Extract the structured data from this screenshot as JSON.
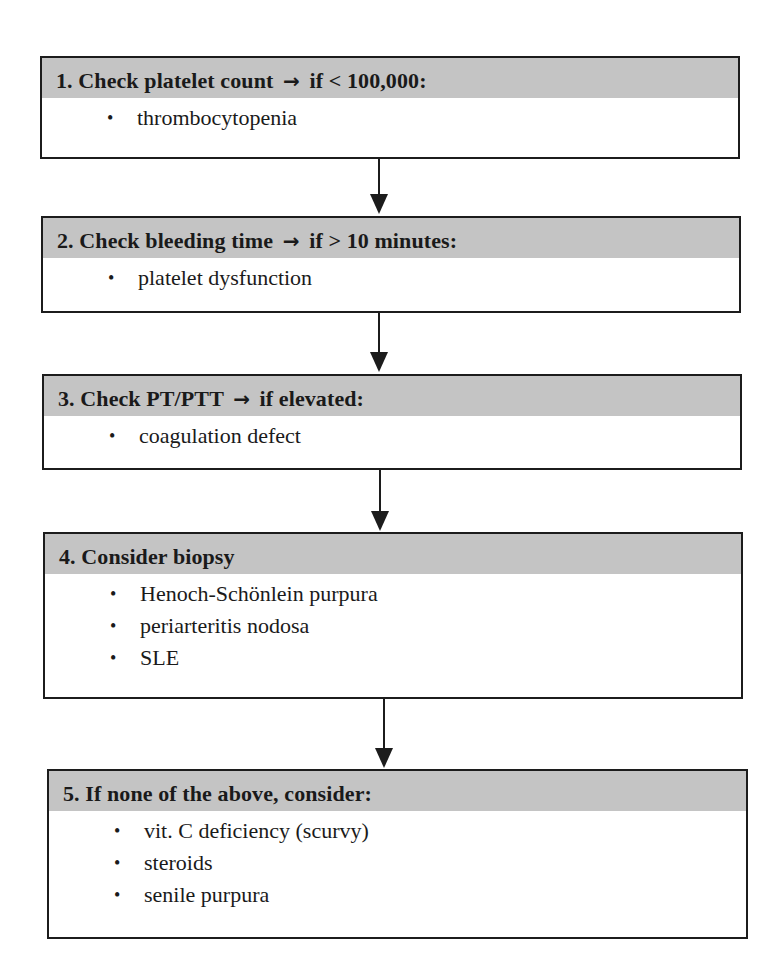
{
  "flowchart": {
    "steps": [
      {
        "number": "1.",
        "title": "Check platelet count",
        "arrow": "→",
        "condition": "if < 100,000:",
        "items": [
          "thrombocytopenia"
        ]
      },
      {
        "number": "2.",
        "title": "Check bleeding time",
        "arrow": "→",
        "condition": "if > 10 minutes:",
        "items": [
          "platelet dysfunction"
        ]
      },
      {
        "number": "3.",
        "title": "Check PT/PTT",
        "arrow": "→",
        "condition": "if elevated:",
        "items": [
          "coagulation defect"
        ]
      },
      {
        "number": "4.",
        "title": "Consider biopsy",
        "arrow": "",
        "condition": "",
        "items": [
          "Henoch-Schönlein purpura",
          "periarteritis nodosa",
          "SLE"
        ]
      },
      {
        "number": "5.",
        "title": "If none of the above, consider:",
        "arrow": "",
        "condition": "",
        "items": [
          "vit. C deficiency (scurvy)",
          "steroids",
          "senile purpura"
        ]
      }
    ],
    "bullet": "•"
  },
  "colors": {
    "header_bg": "#c4c4c4",
    "border": "#1c1c1c",
    "text": "#1a1a1a"
  }
}
